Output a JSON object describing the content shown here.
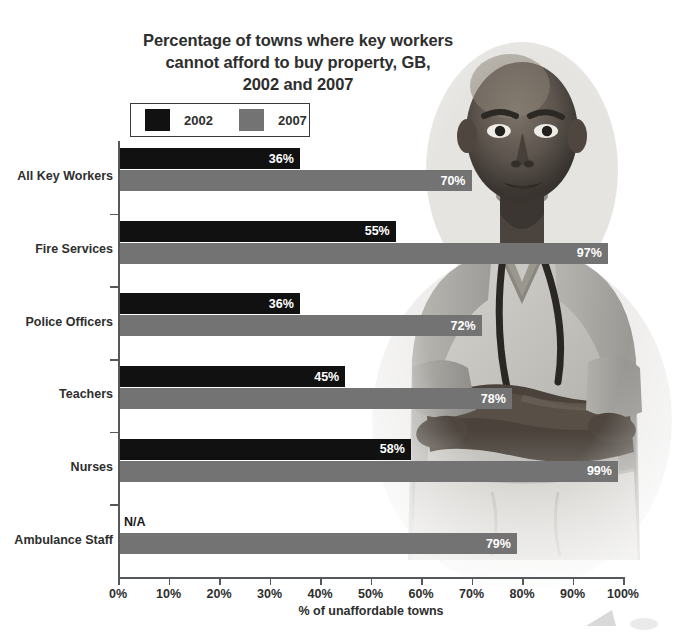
{
  "title": {
    "line1": "Percentage of towns where key workers",
    "line2": "cannot afford to buy property, GB,",
    "line3": "2002 and 2007"
  },
  "legend": {
    "items": [
      {
        "label": "2002",
        "color": "#111111"
      },
      {
        "label": "2007",
        "color": "#737373"
      }
    ]
  },
  "axis": {
    "x_title": "% of unaffordable towns",
    "x_ticks": [
      "0%",
      "10%",
      "20%",
      "30%",
      "40%",
      "50%",
      "60%",
      "70%",
      "80%",
      "90%",
      "100%"
    ]
  },
  "photo": {
    "alt": "grayscale photograph of a key worker in medical scrubs with a stethoscope, arms crossed"
  },
  "chart_data": {
    "type": "bar",
    "orientation": "horizontal",
    "title": "Percentage of towns where key workers cannot afford to buy property, GB, 2002 and 2007",
    "xlabel": "% of unaffordable towns",
    "ylabel": "",
    "xlim": [
      0,
      100
    ],
    "xticks": [
      0,
      10,
      20,
      30,
      40,
      50,
      60,
      70,
      80,
      90,
      100
    ],
    "grid": false,
    "legend_position": "top-left",
    "categories": [
      "All Key Workers",
      "Fire Services",
      "Police Officers",
      "Teachers",
      "Nurses",
      "Ambulance Staff"
    ],
    "series": [
      {
        "name": "2002",
        "color": "#111111",
        "values": [
          36,
          55,
          36,
          45,
          58,
          null
        ],
        "labels": [
          "36%",
          "55%",
          "36%",
          "45%",
          "58%",
          "N/A"
        ]
      },
      {
        "name": "2007",
        "color": "#737373",
        "values": [
          70,
          97,
          72,
          78,
          99,
          79
        ],
        "labels": [
          "70%",
          "97%",
          "72%",
          "78%",
          "99%",
          "79%"
        ]
      }
    ]
  }
}
